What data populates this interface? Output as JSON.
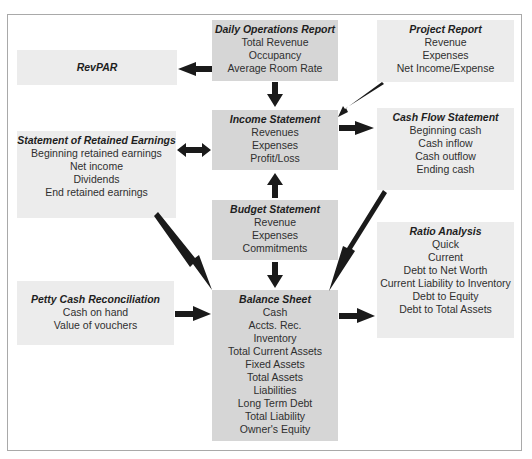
{
  "diagram": {
    "colors": {
      "frame_border": "#a9a9a9",
      "box_light": "#ececec",
      "box_dark": "#d6d6d6",
      "arrow": "#1a1a1a"
    },
    "nodes": {
      "revpar": {
        "title": "RevPAR",
        "lines": []
      },
      "daily_operations": {
        "title": "Daily Operations Report",
        "lines": [
          "Total Revenue",
          "Occupancy",
          "Average Room Rate"
        ]
      },
      "project_report": {
        "title": "Project Report",
        "lines": [
          "Revenue",
          "Expenses",
          "Net Income/Expense"
        ]
      },
      "income_statement": {
        "title": "Income Statement",
        "lines": [
          "Revenues",
          "Expenses",
          "Profit/Loss"
        ]
      },
      "cash_flow": {
        "title": "Cash Flow Statement",
        "lines": [
          "Beginning cash",
          "Cash inflow",
          "Cash outflow",
          "Ending cash"
        ]
      },
      "retained_earnings": {
        "title": "Statement of Retained Earnings",
        "lines": [
          "Beginning retained earnings",
          "Net income",
          "Dividends",
          "End retained earnings"
        ]
      },
      "budget": {
        "title": "Budget Statement",
        "lines": [
          "Revenue",
          "Expenses",
          "Commitments"
        ]
      },
      "ratio_analysis": {
        "title": "Ratio Analysis",
        "lines": [
          "Quick",
          "Current",
          "Debt to Net Worth",
          "Current Liability to Inventory",
          "Debt to Equity",
          "Debt to Total Assets"
        ]
      },
      "petty_cash": {
        "title": "Petty Cash Reconciliation",
        "lines": [
          "Cash on hand",
          "Value of vouchers"
        ]
      },
      "balance_sheet": {
        "title": "Balance Sheet",
        "lines": [
          "Cash",
          "Accts. Rec.",
          "Inventory",
          "Total Current Assets",
          "Fixed Assets",
          "Total Assets",
          "Liabilities",
          "Long Term Debt",
          "Total Liability",
          "Owner's Equity"
        ]
      }
    },
    "edges": [
      {
        "from": "Daily Operations Report",
        "to": "RevPAR"
      },
      {
        "from": "Daily Operations Report",
        "to": "Income Statement"
      },
      {
        "from": "Project Report",
        "to": "Income Statement"
      },
      {
        "from": "Income Statement",
        "to": "Cash Flow Statement"
      },
      {
        "from": "Income Statement",
        "to": "Statement of Retained Earnings",
        "bidirectional": true
      },
      {
        "from": "Budget Statement",
        "to": "Income Statement"
      },
      {
        "from": "Budget Statement",
        "to": "Balance Sheet"
      },
      {
        "from": "Statement of Retained Earnings",
        "to": "Balance Sheet"
      },
      {
        "from": "Cash Flow Statement",
        "to": "Balance Sheet"
      },
      {
        "from": "Petty Cash Reconciliation",
        "to": "Balance Sheet"
      },
      {
        "from": "Balance Sheet",
        "to": "Ratio Analysis"
      }
    ]
  }
}
